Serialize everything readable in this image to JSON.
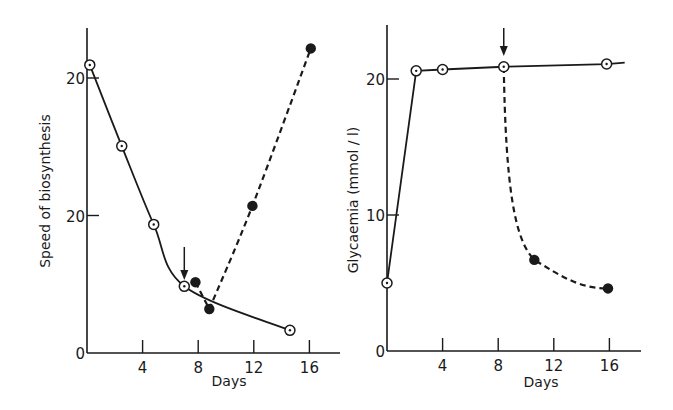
{
  "chart_data": [
    {
      "type": "line",
      "panel": "left",
      "title": "",
      "xlabel": "Days",
      "ylabel": "Speed of biosynthesis",
      "xlim": [
        0,
        18
      ],
      "ylim": [
        0,
        47
      ],
      "grid": false,
      "x_ticks": [
        4,
        8,
        12,
        16
      ],
      "x_tick_labels": [
        "4",
        "8",
        "12",
        "16"
      ],
      "y_ticks": [
        0,
        20,
        40
      ],
      "y_tick_labels": [
        "0",
        "20",
        "20"
      ],
      "series": [
        {
          "name": "control (open circles, solid line)",
          "style": "solid",
          "marker": "open-circle-dot",
          "x": [
            0.2,
            2.5,
            4.8,
            7.0,
            14.6
          ],
          "y": [
            41.9,
            30.1,
            18.7,
            9.7,
            3.3
          ]
        },
        {
          "name": "treated (filled circles, dashed line)",
          "style": "dashed",
          "marker": "filled-circle",
          "x": [
            7.8,
            8.8,
            11.9,
            16.1
          ],
          "y": [
            10.3,
            6.4,
            21.4,
            44.3
          ]
        }
      ],
      "annotations": [
        {
          "type": "arrow-down",
          "x": 7.0,
          "label": ""
        }
      ]
    },
    {
      "type": "line",
      "panel": "right",
      "title": "",
      "xlabel": "Days",
      "ylabel": "Glycaemia (mmol / l)",
      "xlim": [
        0,
        18.5
      ],
      "ylim": [
        0,
        24
      ],
      "grid": false,
      "x_ticks": [
        4,
        8,
        12,
        16
      ],
      "x_tick_labels": [
        "4",
        "8",
        "12",
        "16"
      ],
      "y_ticks": [
        0,
        10,
        20
      ],
      "y_tick_labels": [
        "0",
        "10",
        "20"
      ],
      "series": [
        {
          "name": "control (open circles, solid line)",
          "style": "solid",
          "marker": "open-circle-dot",
          "x": [
            0,
            2.1,
            4.0,
            8.4,
            15.8
          ],
          "y": [
            5.0,
            20.6,
            20.7,
            20.9,
            21.1
          ]
        },
        {
          "name": "treated (filled circles, dashed line)",
          "style": "dashed",
          "marker": "filled-circle",
          "x": [
            8.4,
            10.6,
            15.9
          ],
          "y": [
            20.9,
            6.7,
            4.6
          ]
        }
      ],
      "annotations": [
        {
          "type": "arrow-down",
          "x": 8.4,
          "label": ""
        }
      ]
    }
  ],
  "colors": {
    "ink": "#1a1a1a",
    "background": "#ffffff"
  }
}
